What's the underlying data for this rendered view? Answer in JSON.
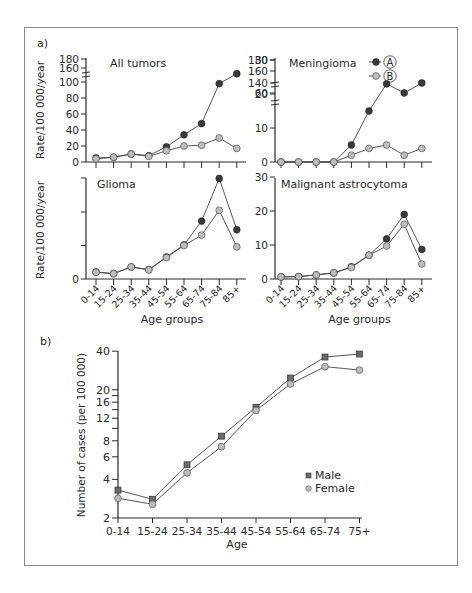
{
  "figure": {
    "panel_a_label": "a)",
    "panel_b_label": "b)"
  },
  "chart_data": [
    {
      "type": "line",
      "title": "All tumors",
      "xlabel": "",
      "ylabel": "Rate/100 000/year",
      "categories": [
        "0-14",
        "15-24",
        "25-34",
        "35-44",
        "45-54",
        "55-64",
        "65-74",
        "75-84",
        "85+"
      ],
      "yticks": [
        "0",
        "20",
        "40",
        "60",
        "80",
        "100",
        "160",
        "180"
      ],
      "axis_break": "between 100 and 160",
      "series": [
        {
          "name": "A",
          "marker": "filled-circle",
          "color": "#3a3a3a",
          "values": [
            5,
            6,
            10,
            8,
            19,
            34,
            48,
            98,
            155
          ]
        },
        {
          "name": "B",
          "marker": "open-circle",
          "color": "#bdbdbd",
          "values": [
            4,
            6,
            10,
            7,
            14,
            20,
            21,
            30,
            17
          ]
        }
      ]
    },
    {
      "type": "line",
      "title": "Meningioma",
      "xlabel": "",
      "ylabel": "",
      "categories": [
        "0-14",
        "15-24",
        "25-34",
        "35-44",
        "45-54",
        "55-64",
        "65-74",
        "75-84",
        "85+"
      ],
      "yticks": [
        "0",
        "10",
        "20",
        "30",
        "60",
        "140",
        "160",
        "180"
      ],
      "axis_break": "between 30 and 60, and between 60 and 140",
      "legend": {
        "position": "top-right",
        "entries": [
          "A",
          "B"
        ]
      },
      "series": [
        {
          "name": "A",
          "marker": "filled-circle",
          "color": "#3a3a3a",
          "values": [
            0,
            0,
            0,
            0,
            5,
            15,
            23,
            58,
            140
          ]
        },
        {
          "name": "B",
          "marker": "open-circle",
          "color": "#bdbdbd",
          "values": [
            0,
            0,
            0,
            0,
            2,
            4,
            5,
            2,
            4
          ]
        }
      ]
    },
    {
      "type": "line",
      "title": "Glioma",
      "xlabel": "Age groups",
      "ylabel": "Rate/100 000/year",
      "categories": [
        "0-14",
        "15-24",
        "25-34",
        "35-44",
        "45-54",
        "55-64",
        "65-74",
        "75-84",
        "85+"
      ],
      "yticks": [
        "0"
      ],
      "ylim": [
        0,
        30
      ],
      "series": [
        {
          "name": "A",
          "marker": "filled-circle",
          "color": "#3a3a3a",
          "values": [
            2.1,
            1.6,
            3.6,
            2.8,
            6.6,
            10.2,
            17.3,
            30,
            14.7
          ]
        },
        {
          "name": "B",
          "marker": "open-circle",
          "color": "#bdbdbd",
          "values": [
            2.0,
            1.6,
            3.6,
            2.7,
            6.4,
            10.0,
            13.1,
            20.5,
            9.6
          ]
        }
      ]
    },
    {
      "type": "line",
      "title": "Malignant astrocytoma",
      "xlabel": "Age groups",
      "ylabel": "",
      "categories": [
        "0-14",
        "15-24",
        "25-34",
        "35-44",
        "45-54",
        "55-64",
        "65-74",
        "75-84",
        "85+"
      ],
      "yticks": [
        "0",
        "10",
        "20",
        "30"
      ],
      "ylim": [
        0,
        30
      ],
      "series": [
        {
          "name": "A",
          "marker": "filled-circle",
          "color": "#3a3a3a",
          "values": [
            0.6,
            0.7,
            1.2,
            1.8,
            3.6,
            7.0,
            11.8,
            19.0,
            8.7
          ]
        },
        {
          "name": "B",
          "marker": "open-circle",
          "color": "#bdbdbd",
          "values": [
            0.6,
            0.7,
            1.2,
            1.8,
            3.4,
            7.0,
            9.7,
            16.1,
            4.4
          ]
        }
      ]
    },
    {
      "type": "line",
      "title": "",
      "xlabel": "Age",
      "ylabel": "Number of cases (per 100 000)",
      "yscale": "log",
      "ylim": [
        2,
        40
      ],
      "categories": [
        "0-14",
        "15-24",
        "25-34",
        "35-44",
        "45-54",
        "55-64",
        "65-74",
        "75+"
      ],
      "yticks": [
        "2",
        "4",
        "6",
        "8",
        "12",
        "16",
        "20",
        "40"
      ],
      "legend": {
        "position": "bottom-right",
        "entries": [
          "Male",
          "Female"
        ]
      },
      "series": [
        {
          "name": "Male",
          "marker": "filled-square",
          "color": "#6b6b6b",
          "values": [
            3.3,
            2.8,
            5.2,
            8.7,
            14.6,
            24.7,
            36,
            38
          ]
        },
        {
          "name": "Female",
          "marker": "open-circle",
          "color": "#bdbdbd",
          "values": [
            2.85,
            2.56,
            4.5,
            7.2,
            13.8,
            22.2,
            30.3,
            28.5
          ]
        }
      ]
    }
  ]
}
